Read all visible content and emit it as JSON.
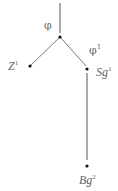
{
  "diagram": {
    "type": "tree",
    "nodes": [
      {
        "id": "root",
        "label": "φ",
        "x": 60,
        "y": 37
      },
      {
        "id": "z1",
        "label": "Z",
        "sup": "1",
        "x": 30,
        "y": 66
      },
      {
        "id": "sg1",
        "label": "Sg",
        "sup": "1",
        "edge_label": "φ",
        "edge_sup": "1",
        "x": 87,
        "y": 69
      },
      {
        "id": "bg2",
        "label": "Bg",
        "sup": "2",
        "x": 87,
        "y": 166
      }
    ],
    "edges": [
      {
        "from": "top",
        "to": "root"
      },
      {
        "from": "root",
        "to": "z1"
      },
      {
        "from": "root",
        "to": "sg1"
      },
      {
        "from": "sg1",
        "to": "bg2"
      }
    ],
    "colors": {
      "line": "#555555",
      "dot": "#111111",
      "text": "#666666"
    }
  }
}
